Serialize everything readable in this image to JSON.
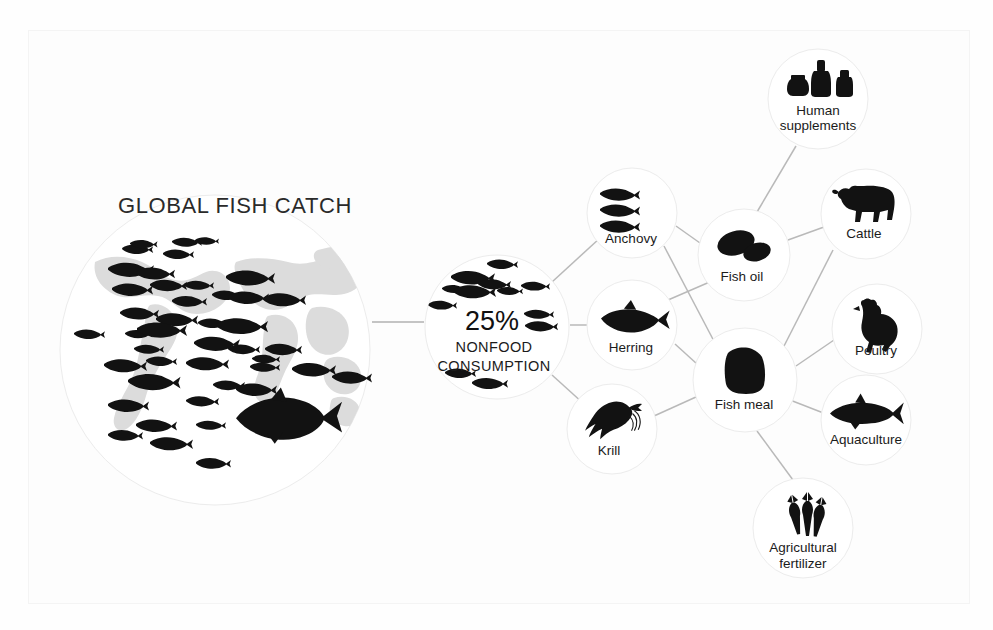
{
  "diagram": {
    "title": "GLOBAL FISH CATCH",
    "type": "flow-infographic",
    "background_color": "#ffffff",
    "ink_color": "#121212",
    "map_color": "#dcdcdc",
    "connector_color": "#b9b9b9",
    "source_node": {
      "id": "global-fish-catch",
      "label": "GLOBAL FISH CATCH",
      "icon": "world-map-with-fish-school-icon",
      "cx": 215,
      "cy": 350,
      "r": 155
    },
    "hub_node": {
      "id": "nonfood-consumption",
      "percent": "25%",
      "line1": "NONFOOD",
      "line2": "CONSUMPTION",
      "icon": "fish-school-icon",
      "cx": 497,
      "cy": 327,
      "r": 72
    },
    "stage_nodes": [
      {
        "id": "anchovy",
        "label": "Anchovy",
        "icon": "three-anchovies-icon",
        "cx": 632,
        "cy": 213,
        "r": 45
      },
      {
        "id": "herring",
        "label": "Herring",
        "icon": "herring-fish-icon",
        "cx": 632,
        "cy": 325,
        "r": 45
      },
      {
        "id": "krill",
        "label": "Krill",
        "icon": "krill-shrimp-icon",
        "cx": 612,
        "cy": 429,
        "r": 45
      }
    ],
    "product_nodes": [
      {
        "id": "fish-oil",
        "label": "Fish oil",
        "icon": "oil-capsules-icon",
        "cx": 744,
        "cy": 255,
        "r": 46
      },
      {
        "id": "fish-meal",
        "label": "Fish meal",
        "icon": "meal-sack-icon",
        "cx": 745,
        "cy": 380,
        "r": 52
      }
    ],
    "use_nodes": [
      {
        "id": "human-supplements",
        "label_line1": "Human",
        "label_line2": "supplements",
        "label": "Human supplements",
        "icon": "supplement-bottles-icon",
        "cx": 818,
        "cy": 99,
        "r": 50
      },
      {
        "id": "cattle",
        "label": "Cattle",
        "icon": "cow-icon",
        "cx": 866,
        "cy": 214,
        "r": 45
      },
      {
        "id": "poultry",
        "label": "Poultry",
        "icon": "chicken-icon",
        "cx": 877,
        "cy": 329,
        "r": 45
      },
      {
        "id": "aquaculture",
        "label": "Aquaculture",
        "icon": "salmon-icon",
        "cx": 866,
        "cy": 420,
        "r": 45
      },
      {
        "id": "agricultural-fertilizer",
        "label_line1": "Agricultural",
        "label_line2": "fertilizer",
        "label": "Agricultural fertilizer",
        "icon": "wheat-stalks-icon",
        "cx": 803,
        "cy": 528,
        "r": 50
      }
    ],
    "edges": [
      {
        "from": "global-fish-catch",
        "to": "nonfood-consumption"
      },
      {
        "from": "nonfood-consumption",
        "to": "anchovy"
      },
      {
        "from": "nonfood-consumption",
        "to": "herring"
      },
      {
        "from": "nonfood-consumption",
        "to": "krill"
      },
      {
        "from": "anchovy",
        "to": "fish-oil"
      },
      {
        "from": "anchovy",
        "to": "fish-meal"
      },
      {
        "from": "herring",
        "to": "fish-oil"
      },
      {
        "from": "herring",
        "to": "fish-meal"
      },
      {
        "from": "krill",
        "to": "fish-meal"
      },
      {
        "from": "fish-oil",
        "to": "human-supplements"
      },
      {
        "from": "fish-meal",
        "to": "cattle"
      },
      {
        "from": "fish-meal",
        "to": "poultry"
      },
      {
        "from": "fish-meal",
        "to": "aquaculture"
      },
      {
        "from": "fish-meal",
        "to": "agricultural-fertilizer"
      },
      {
        "from": "fish-oil",
        "to": "cattle"
      }
    ]
  }
}
